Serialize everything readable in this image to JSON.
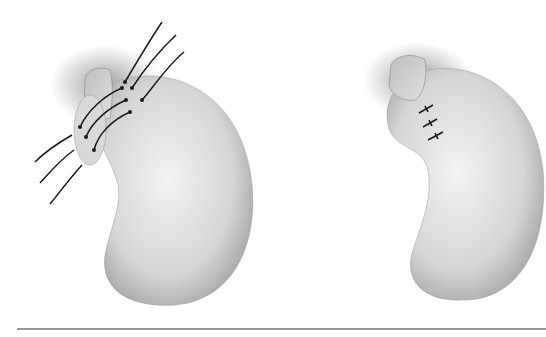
{
  "figure": {
    "panels": [
      {
        "id": "left",
        "label": "",
        "description": "stomach-with-sutures-placed",
        "suture_count": 3
      },
      {
        "id": "right",
        "label": "",
        "description": "stomach-with-sutures-tied",
        "knot_count": 3
      }
    ],
    "colors": {
      "background": "#ffffff",
      "organ_light": "#ececec",
      "organ_mid": "#c8c8c8",
      "organ_dark": "#8a8a8a",
      "suture": "#1a1a1a",
      "rule": "#9a9a9a"
    }
  }
}
